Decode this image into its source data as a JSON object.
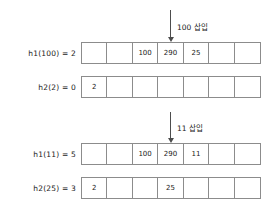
{
  "diagram": {
    "cell_count": 7,
    "colors": {
      "border": "#8c8c8c",
      "text": "#1a1a1a",
      "arrow": "#4d4d4d",
      "background": "#ffffff"
    },
    "annotations": [
      {
        "name": "insert-100",
        "text": "100 삽입",
        "target_cell_index": 3
      },
      {
        "name": "insert-11",
        "text": "11 삽입",
        "target_cell_index": 3
      }
    ],
    "rows": [
      {
        "name": "h1-100",
        "label": "h1(100) = 2",
        "cells": [
          "",
          "",
          "100",
          "290",
          "25",
          "",
          ""
        ]
      },
      {
        "name": "h2-2",
        "label": "h2(2) = 0",
        "cells": [
          "2",
          "",
          "",
          "",
          "",
          "",
          ""
        ]
      },
      {
        "name": "h1-11",
        "label": "h1(11) = 5",
        "cells": [
          "",
          "",
          "100",
          "290",
          "11",
          "",
          ""
        ]
      },
      {
        "name": "h2-25",
        "label": "h2(25) = 3",
        "cells": [
          "2",
          "",
          "",
          "25",
          "",
          "",
          ""
        ]
      }
    ]
  }
}
